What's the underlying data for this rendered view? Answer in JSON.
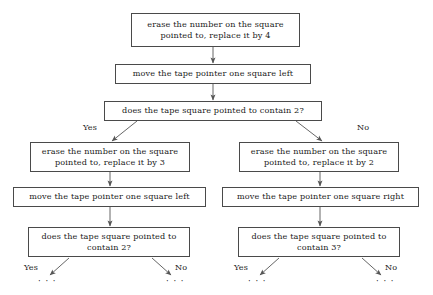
{
  "diagram": {
    "type": "flowchart",
    "colors": {
      "background": "#ffffff",
      "box_border": "#4a4a4a",
      "text": "#1a1a1a",
      "arrow": "#555555"
    },
    "nodes": [
      {
        "id": "n1",
        "kind": "process",
        "text": "erase the number on the square\npointed to, replace it by 4"
      },
      {
        "id": "n2",
        "kind": "process",
        "text": "move the tape pointer one square left"
      },
      {
        "id": "n3",
        "kind": "decision",
        "text": "does the tape square pointed to contain 2?"
      },
      {
        "id": "n4",
        "kind": "process",
        "text": "erase the number on the square\npointed to, replace it by 3"
      },
      {
        "id": "n5",
        "kind": "process",
        "text": "move the tape pointer one square left"
      },
      {
        "id": "n6",
        "kind": "decision",
        "text": "does the tape square pointed to\ncontain 2?"
      },
      {
        "id": "n7",
        "kind": "process",
        "text": "erase the number on the square\npointed to, replace it by 2"
      },
      {
        "id": "n8",
        "kind": "process",
        "text": "move the tape pointer one square right"
      },
      {
        "id": "n9",
        "kind": "decision",
        "text": "does the tape square pointed to\ncontain 3?"
      }
    ],
    "edge_labels": {
      "branch1_yes": "Yes",
      "branch1_no": "No",
      "branch2_yes": "Yes",
      "branch2_no": "No",
      "branch3_yes": "Yes",
      "branch3_no": "No"
    },
    "continuation": {
      "left_yes": "· · ·",
      "left_no": "· · ·",
      "right_yes": "· · ·",
      "right_no": "· · ·"
    }
  }
}
